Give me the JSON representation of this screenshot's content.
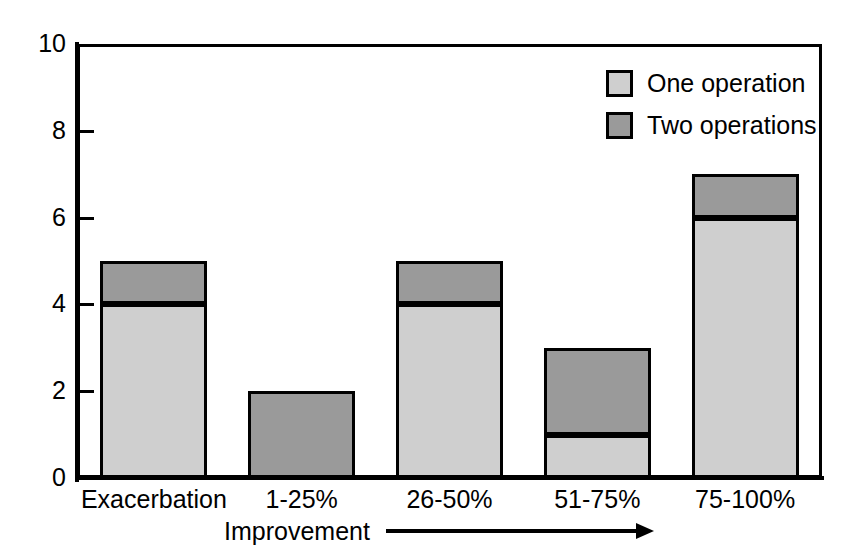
{
  "chart_data": {
    "type": "bar",
    "subtype": "stacked-bar",
    "title": "",
    "xlabel": "Improvement",
    "ylabel": "",
    "categories": [
      "Exacerbation",
      "1-25%",
      "26-50%",
      "51-75%",
      "75-100%"
    ],
    "series": [
      {
        "name": "One operation",
        "values": [
          4,
          0,
          4,
          1,
          6
        ],
        "color": "#cfcfcf"
      },
      {
        "name": "Two operations",
        "values": [
          1,
          2,
          1,
          2,
          1
        ],
        "color": "#9a9a9a"
      }
    ],
    "totals": [
      5,
      2,
      5,
      3,
      7
    ],
    "ylim": [
      0,
      10
    ],
    "yticks": [
      0,
      2,
      4,
      6,
      8,
      10
    ],
    "ytick_labels": [
      "0",
      "2",
      "4",
      "6",
      "8",
      "10"
    ],
    "grid": false,
    "legend_position": "top-right",
    "xlabel_arrow": "right-arrow"
  },
  "axes": {
    "y_labels": [
      "10",
      "8",
      "6",
      "4",
      "2",
      "0"
    ],
    "x_labels": [
      "Exacerbation",
      "1-25%",
      "26-50%",
      "51-75%",
      "75-100%"
    ],
    "x_title": "Improvement"
  },
  "legend": {
    "items": [
      {
        "label": "One operation",
        "swatch": "light-gray-swatch"
      },
      {
        "label": "Two operations",
        "swatch": "dark-gray-swatch"
      }
    ]
  },
  "colors": {
    "one_operation": "#cfcfcf",
    "two_operations": "#9a9a9a",
    "outline": "#000000",
    "background": "#ffffff"
  }
}
